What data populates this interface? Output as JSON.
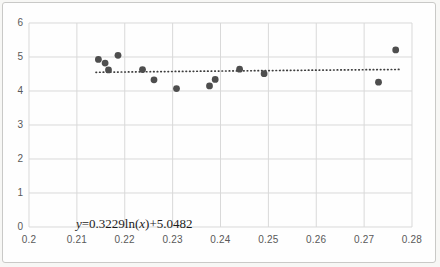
{
  "chart_data": {
    "type": "scatter",
    "title": "",
    "xlabel": "",
    "ylabel": "",
    "xlim": [
      0.2,
      0.28
    ],
    "ylim": [
      0,
      6
    ],
    "x_ticks": [
      {
        "value": 0.2,
        "label": "0.2"
      },
      {
        "value": 0.21,
        "label": "0.21"
      },
      {
        "value": 0.22,
        "label": "0.22"
      },
      {
        "value": 0.23,
        "label": "0.23"
      },
      {
        "value": 0.24,
        "label": "0.24"
      },
      {
        "value": 0.25,
        "label": "0.25"
      },
      {
        "value": 0.26,
        "label": "0.26"
      },
      {
        "value": 0.27,
        "label": "0.27"
      },
      {
        "value": 0.28,
        "label": "0.28"
      }
    ],
    "y_ticks": [
      {
        "value": 0,
        "label": "0"
      },
      {
        "value": 1,
        "label": "1"
      },
      {
        "value": 2,
        "label": "2"
      },
      {
        "value": 3,
        "label": "3"
      },
      {
        "value": 4,
        "label": "4"
      },
      {
        "value": 5,
        "label": "5"
      },
      {
        "value": 6,
        "label": "6"
      }
    ],
    "grid": true,
    "legend": "none",
    "series": [
      {
        "name": "observations",
        "marker": "circle",
        "points": [
          [
            0.2145,
            4.93
          ],
          [
            0.2159,
            4.82
          ],
          [
            0.2166,
            4.62
          ],
          [
            0.2186,
            5.05
          ],
          [
            0.2237,
            4.63
          ],
          [
            0.2261,
            4.33
          ],
          [
            0.2308,
            4.07
          ],
          [
            0.2377,
            4.15
          ],
          [
            0.2389,
            4.34
          ],
          [
            0.244,
            4.64
          ],
          [
            0.2491,
            4.51
          ],
          [
            0.273,
            4.26
          ],
          [
            0.2766,
            5.21
          ]
        ]
      }
    ],
    "trendline": {
      "type": "logarithmic",
      "coef_a": 0.3229,
      "coef_b": 5.0482,
      "x_start": 0.214,
      "x_end": 0.2775,
      "style": "dotted",
      "equation_parts": [
        {
          "text": "y",
          "italic": true
        },
        {
          "text": "=0.3229ln(",
          "italic": false
        },
        {
          "text": "x",
          "italic": true
        },
        {
          "text": ")+5.0482",
          "italic": false
        }
      ]
    }
  },
  "colors": {
    "point": "#4e4e4e",
    "trendline": "#3d3d3d",
    "gridline": "#d9d9d9",
    "tick_text": "#595959",
    "frame_border": "#c9c9c7",
    "plot_background": "#fefefe"
  }
}
